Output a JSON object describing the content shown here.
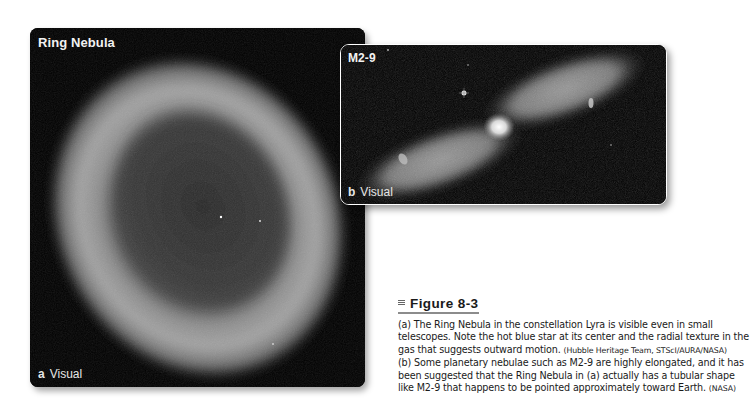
{
  "figure": {
    "panels": [
      {
        "id": "a",
        "title": "Ring Nebula",
        "label_letter": "a",
        "label_text": "Visual",
        "image_description": "Ring Nebula grayscale photo"
      },
      {
        "id": "b",
        "title": "M2-9",
        "label_letter": "b",
        "label_text": "Visual",
        "image_description": "M2-9 bipolar nebula grayscale photo"
      }
    ],
    "caption": {
      "heading": "Figure 8-3",
      "paragraph_a": "(a) The Ring Nebula in the constellation Lyra is visible even in small telescopes. Note the hot blue star at its center and the radial texture in the gas that suggests outward motion.",
      "credit_a": "(Hubble Heritage Team, STScI/AURA/NASA)",
      "paragraph_b": "(b) Some planetary nebulae such as M2-9 are highly elongated, and it has been suggested that the Ring Nebula in (a) actually has a tubular shape like M2-9 that happens to be pointed approximately toward Earth.",
      "credit_b": "(NASA)"
    }
  }
}
